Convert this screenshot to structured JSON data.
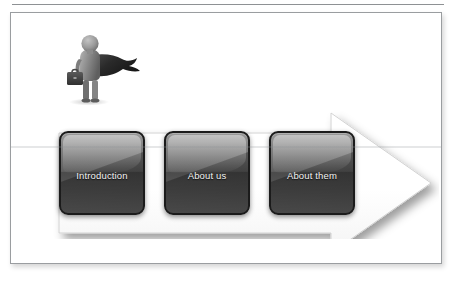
{
  "page": {
    "background_color": "#ffffff",
    "top_rule": {
      "name": "horizontal-rule",
      "color": "#8e9194"
    }
  },
  "slide": {
    "frame": {
      "border_color": "#9a9da0",
      "background_color": "#ffffff"
    },
    "figure": {
      "icon_name": "businessman-with-briefcase-icon",
      "description": "3D gray businessman figure holding a briefcase with a dark cape behind",
      "body_color": "#8a8a8a",
      "cape_color": "#2e2e2e",
      "briefcase_color": "#3a3a3a"
    },
    "arrow": {
      "icon_name": "right-arrow-shape",
      "direction": "right",
      "fill_color": "#ffffff",
      "outline_color": "#c9c9c9",
      "shadow_color": "rgba(0,0,0,0.35)"
    },
    "chips": [
      {
        "label": "Introduction",
        "fill_top": "#9a9a9a",
        "fill_bottom": "#4b4b4b",
        "text_color": "#f2f2f2"
      },
      {
        "label": "About us",
        "fill_top": "#9a9a9a",
        "fill_bottom": "#4b4b4b",
        "text_color": "#f2f2f2"
      },
      {
        "label": "About them",
        "fill_top": "#9a9a9a",
        "fill_bottom": "#4b4b4b",
        "text_color": "#f2f2f2"
      }
    ]
  }
}
